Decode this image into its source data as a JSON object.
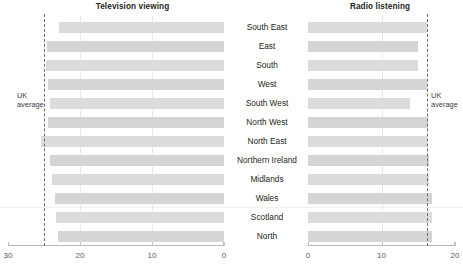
{
  "figure": {
    "footnote": "",
    "uk_average_label_line1": "UK",
    "uk_average_label_line2": "average"
  },
  "panels": {
    "left": {
      "title": "Television viewing"
    },
    "right": {
      "title": "Radio listening"
    }
  },
  "regions": [
    "South East",
    "East",
    "South",
    "West",
    "South West",
    "North West",
    "North East",
    "Northern Ireland",
    "Midlands",
    "Wales",
    "Scotland",
    "North"
  ],
  "chart_data": [
    {
      "type": "bar",
      "title": "Television viewing",
      "orientation": "horizontal",
      "direction": "right-to-left",
      "xlabel": "",
      "ylabel": "",
      "xlim": [
        30,
        0
      ],
      "ticks": [
        30,
        20,
        10,
        0
      ],
      "ticklabels": [
        "30",
        "20",
        "10",
        "0"
      ],
      "grid": true,
      "categories": [
        "South East",
        "East",
        "South",
        "West",
        "South West",
        "North West",
        "North East",
        "Northern Ireland",
        "Midlands",
        "Wales",
        "Scotland",
        "North"
      ],
      "values": [
        22.9,
        24.6,
        24.7,
        24.5,
        24.2,
        24.5,
        25.4,
        24.1,
        23.9,
        23.5,
        23.4,
        23.0
      ],
      "reference_line": {
        "label": "UK average",
        "value": 25.0,
        "style": "dashed"
      }
    },
    {
      "type": "bar",
      "title": "Radio listening",
      "orientation": "horizontal",
      "direction": "left-to-right",
      "xlabel": "",
      "ylabel": "",
      "xlim": [
        0,
        20
      ],
      "ticks": [
        0,
        10,
        20
      ],
      "ticklabels": [
        "0",
        "10",
        "20"
      ],
      "grid": true,
      "categories": [
        "South East",
        "East",
        "South",
        "West",
        "South West",
        "North West",
        "North East",
        "Northern Ireland",
        "Midlands",
        "Wales",
        "Scotland",
        "North"
      ],
      "values": [
        16.2,
        14.9,
        14.9,
        16.2,
        13.9,
        16.3,
        16.2,
        16.5,
        16.4,
        16.9,
        16.9,
        16.9
      ],
      "reference_line": {
        "label": "UK average",
        "value": 16.2,
        "style": "dashed"
      }
    }
  ],
  "colors": {
    "bar": "#dcdcdc",
    "grid": "#e8e8e8",
    "axis": "#b9b9b9",
    "reference_line": "#6f6f6f",
    "text": "#231f20"
  }
}
